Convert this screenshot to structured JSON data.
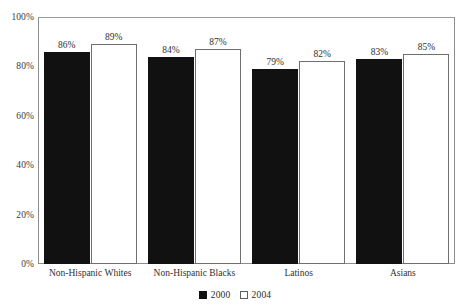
{
  "chart_data": {
    "type": "bar",
    "title": "",
    "subtitle": "",
    "xlabel": "",
    "ylabel": "",
    "ylim": [
      0,
      100
    ],
    "y_unit": "%",
    "grid": false,
    "legend_position": "bottom-center",
    "categories": [
      "Non-Hispanic Whites",
      "Non-Hispanic Blacks",
      "Latinos",
      "Asians"
    ],
    "y_ticks": [
      {
        "value": 0,
        "label": "0%"
      },
      {
        "value": 20,
        "label": "20%"
      },
      {
        "value": 40,
        "label": "40%"
      },
      {
        "value": 60,
        "label": "60%"
      },
      {
        "value": 80,
        "label": "80%"
      },
      {
        "value": 100,
        "label": "100%"
      }
    ],
    "series": [
      {
        "name": "2000",
        "color": "#111111",
        "style": "filled",
        "values": [
          86,
          84,
          79,
          83
        ],
        "data_labels": [
          "86%",
          "84%",
          "79%",
          "83%"
        ]
      },
      {
        "name": "2004",
        "color": "#ffffff",
        "style": "outlined",
        "values": [
          89,
          87,
          82,
          85
        ],
        "data_labels": [
          "89%",
          "87%",
          "82%",
          "85%"
        ]
      }
    ],
    "legend": [
      {
        "label": "2000",
        "swatch": "fill-2000"
      },
      {
        "label": "2004",
        "swatch": "fill-2004"
      }
    ]
  }
}
